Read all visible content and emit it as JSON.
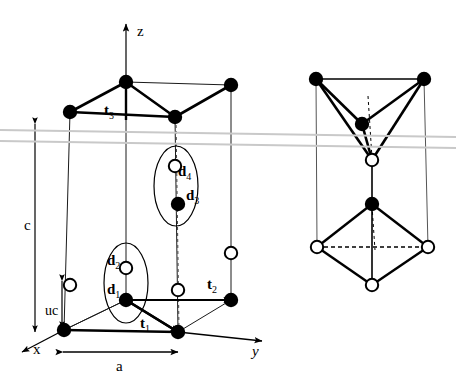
{
  "figure": {
    "type": "crystal-structure-diagram",
    "background_color": "#ffffff",
    "line_color": "#000000",
    "scan_artifact_color": "#c9c9c9"
  },
  "axes": {
    "z": {
      "label": "z",
      "x": 137,
      "y": 36
    },
    "x": {
      "label": "x",
      "x": 33,
      "y": 354
    },
    "y": {
      "label": "y",
      "x": 252,
      "y": 356
    }
  },
  "dimensions": {
    "c": {
      "label": "c",
      "x": 24,
      "y": 230
    },
    "uc": {
      "label": "uc",
      "x": 45,
      "y": 315
    },
    "a": {
      "label": "a",
      "x": 116,
      "y": 371
    }
  },
  "lattice_vectors": [
    {
      "name": "t1",
      "base": "t",
      "sub": "1",
      "x": 140,
      "y": 328
    },
    {
      "name": "t2",
      "base": "t",
      "sub": "2",
      "x": 207,
      "y": 289
    },
    {
      "name": "t3",
      "base": "t",
      "sub": "3",
      "x": 104,
      "y": 115
    }
  ],
  "basis_vectors": [
    {
      "name": "d1",
      "base": "d",
      "sub": "1",
      "x": 107,
      "y": 294
    },
    {
      "name": "d2",
      "base": "d",
      "sub": "2",
      "x": 107,
      "y": 265
    },
    {
      "name": "d3",
      "base": "d",
      "sub": "3",
      "x": 186,
      "y": 200
    },
    {
      "name": "d4",
      "base": "d",
      "sub": "4",
      "x": 178,
      "y": 176
    }
  ],
  "atoms": {
    "filled_legend": "filled-circle-atom",
    "open_legend": "open-circle-atom",
    "main_cell_filled": [
      {
        "cx": 126,
        "cy": 82
      },
      {
        "cx": 70,
        "cy": 112
      },
      {
        "cx": 175,
        "cy": 117
      },
      {
        "cx": 231,
        "cy": 85
      },
      {
        "cx": 126,
        "cy": 300
      },
      {
        "cx": 64,
        "cy": 330
      },
      {
        "cx": 178,
        "cy": 332
      },
      {
        "cx": 231,
        "cy": 300
      },
      {
        "cx": 178,
        "cy": 204
      }
    ],
    "main_cell_open": [
      {
        "cx": 175,
        "cy": 166
      },
      {
        "cx": 126,
        "cy": 268
      },
      {
        "cx": 70,
        "cy": 285
      },
      {
        "cx": 231,
        "cy": 253
      },
      {
        "cx": 178,
        "cy": 290
      }
    ],
    "right_sketch_filled": [
      {
        "cx": 316,
        "cy": 79
      },
      {
        "cx": 424,
        "cy": 79
      },
      {
        "cx": 362,
        "cy": 124
      },
      {
        "cx": 372,
        "cy": 204
      }
    ],
    "right_sketch_open": [
      {
        "cx": 372,
        "cy": 160
      },
      {
        "cx": 317,
        "cy": 247
      },
      {
        "cx": 428,
        "cy": 247
      },
      {
        "cx": 372,
        "cy": 285
      }
    ]
  }
}
